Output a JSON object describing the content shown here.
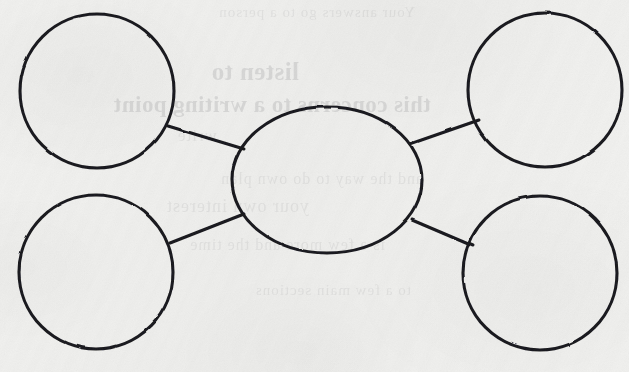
{
  "document": {
    "kind": "bubble-map-worksheet",
    "title": "Bubble Map",
    "paper_color": "#f1f1ef",
    "ink_color": "#15151a",
    "canvas": {
      "width": 629,
      "height": 372
    }
  },
  "diagram": {
    "type": "bubble-map",
    "center": {
      "id": "center-bubble",
      "label": "",
      "shape": "ellipse",
      "cx": 327,
      "cy": 180,
      "rx": 95,
      "ry": 73,
      "stroke_width": 3.1
    },
    "nodes": [
      {
        "id": "bubble-top-left",
        "label": "",
        "shape": "circle",
        "cx": 97,
        "cy": 91,
        "r": 77,
        "stroke_width": 3.1
      },
      {
        "id": "bubble-top-right",
        "label": "",
        "shape": "circle",
        "cx": 545,
        "cy": 90,
        "r": 77,
        "stroke_width": 3.1
      },
      {
        "id": "bubble-bottom-left",
        "label": "",
        "shape": "circle",
        "cx": 96,
        "cy": 272,
        "r": 77,
        "stroke_width": 3.1
      },
      {
        "id": "bubble-bottom-right",
        "label": "",
        "shape": "circle",
        "cx": 540,
        "cy": 273,
        "r": 77,
        "stroke_width": 3.1
      }
    ],
    "connectors": [
      {
        "id": "connector-top-left",
        "from": "bubble-top-left",
        "to": "center-bubble",
        "x1": 168,
        "y1": 126,
        "x2": 244,
        "y2": 149,
        "stroke_width": 3.0
      },
      {
        "id": "connector-top-right",
        "from": "center-bubble",
        "to": "bubble-top-right",
        "x1": 410,
        "y1": 144,
        "x2": 479,
        "y2": 120,
        "stroke_width": 3.0
      },
      {
        "id": "connector-bottom-left",
        "from": "bubble-bottom-left",
        "to": "center-bubble",
        "x1": 170,
        "y1": 243,
        "x2": 244,
        "y2": 214,
        "stroke_width": 3.0
      },
      {
        "id": "connector-bottom-right",
        "from": "center-bubble",
        "to": "bubble-bottom-right",
        "x1": 412,
        "y1": 220,
        "x2": 473,
        "y2": 246,
        "stroke_width": 3.0
      }
    ]
  },
  "showthrough": {
    "description": "faint mirrored handwriting bleeding through from the reverse side of the page",
    "lines": [
      {
        "text": "Your answers go to a person",
        "x": 214,
        "y": 4,
        "size": 15,
        "faint": true
      },
      {
        "text": "listen to",
        "x": 330,
        "y": 58,
        "size": 25,
        "faint": false
      },
      {
        "text": "this concerns to a writing point",
        "x": 198,
        "y": 92,
        "size": 23,
        "faint": false
      },
      {
        "text": "write",
        "x": 412,
        "y": 126,
        "size": 17,
        "faint": true
      },
      {
        "text": "and the way to do own plan",
        "x": 206,
        "y": 170,
        "size": 16,
        "faint": true
      },
      {
        "text": "is a few more and the time",
        "x": 244,
        "y": 236,
        "size": 16,
        "faint": true
      },
      {
        "text": "to a few main sections",
        "x": 218,
        "y": 282,
        "size": 15,
        "faint": true
      },
      {
        "text": "your own interest",
        "x": 320,
        "y": 196,
        "size": 18,
        "faint": true
      }
    ]
  }
}
